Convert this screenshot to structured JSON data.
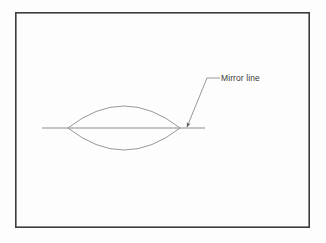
{
  "figure": {
    "type": "geometry-diagram",
    "background_color": "#ffffff",
    "frame": {
      "name": "diagram-border",
      "x": 15,
      "y": 12,
      "width": 295,
      "height": 216,
      "stroke_color": "#3c3c3c",
      "stroke_width": 1.6,
      "fill": "none"
    },
    "stroke_color": "#8c8c8c",
    "label_color": "#3a3a3a"
  },
  "elements": {
    "mirror_line": {
      "name": "mirror-line",
      "label": "Mirror line",
      "x1": 42,
      "y1": 128,
      "x2": 205,
      "y2": 128,
      "stroke_color": "#8c8c8c",
      "stroke_width": 1
    },
    "lens_shape": {
      "name": "lens-shape",
      "description": "vesica / lens formed by two mirrored arcs",
      "left_tip_x": 68,
      "right_tip_x": 180,
      "axis_y": 128,
      "top_y": 98,
      "bottom_y": 159,
      "stroke_color": "#8c8c8c",
      "stroke_width": 0.9,
      "fill": "none",
      "upper_arc_path": "M 68 128 Q 124 84 180 128",
      "lower_arc_path": "M 68 128 Q 124 172 180 128"
    },
    "callout": {
      "name": "mirror-line-callout",
      "text": "Mirror line",
      "text_x": 221,
      "text_y": 73,
      "leader_path": "M 220 78 L 207 78 L 187 127",
      "stroke_color": "#8c8c8c",
      "stroke_width": 0.9,
      "arrow_tip_x": 186,
      "arrow_tip_y": 128,
      "arrow_color": "#5a5a5a"
    }
  }
}
